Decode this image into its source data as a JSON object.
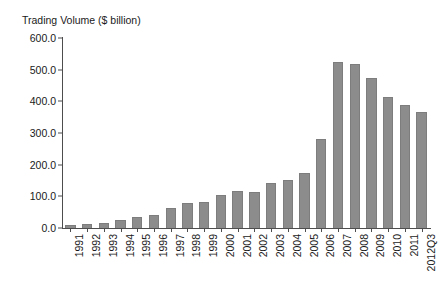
{
  "chart_data": {
    "type": "bar",
    "title": "Trading Volume ($ billion)",
    "xlabel": "",
    "ylabel": "",
    "ylim": [
      0,
      600
    ],
    "ytick_labels": [
      "600.0",
      "500.0",
      "400.0",
      "300.0",
      "200.0",
      "100.0",
      "0.0"
    ],
    "ytick_values": [
      600,
      500,
      400,
      300,
      200,
      100,
      0
    ],
    "grid": false,
    "legend": false,
    "bar_color": "#8c8c8c",
    "axis_color": "#4d4d4d",
    "categories": [
      "1991",
      "1992",
      "1993",
      "1994",
      "1995",
      "1996",
      "1997",
      "1998",
      "1999",
      "2000",
      "2001",
      "2002",
      "2003",
      "2004",
      "2005",
      "2006",
      "2007",
      "2008",
      "2009",
      "2010",
      "2011",
      "2012Q3"
    ],
    "values": [
      8,
      14,
      17,
      24,
      35,
      41,
      62,
      78,
      82,
      105,
      116,
      113,
      141,
      152,
      173,
      281,
      524,
      517,
      474,
      414,
      389,
      366
    ]
  }
}
